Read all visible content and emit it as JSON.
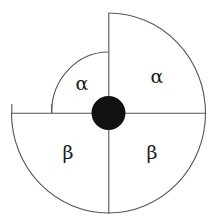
{
  "figure": {
    "background_color": "#ffffff",
    "line_color": "#555555",
    "hub_color": "#111111",
    "label_color": "#1a1a1a"
  },
  "geometry": {
    "center_x": 108.5,
    "center_y": 113.0,
    "outer_radius_x": 97,
    "outer_radius_y": 100,
    "inner_quadrant_radius_x": 57,
    "inner_quadrant_radius_y": 61,
    "hub_radius": 17,
    "vertical_axis_top_y": 13,
    "vertical_axis_bottom_y": 213,
    "horizontal_axis_left_x": 12,
    "horizontal_axis_right_x": 206
  },
  "sectors": [
    {
      "id": "upper-left",
      "label": "α",
      "label_name": "alpha",
      "radius": "small",
      "label_x": 82,
      "label_y": 83
    },
    {
      "id": "upper-right",
      "label": "α",
      "label_name": "alpha",
      "radius": "large",
      "label_x": 157,
      "label_y": 76
    },
    {
      "id": "lower-left",
      "label": "β",
      "label_name": "beta",
      "radius": "large",
      "label_x": 68,
      "label_y": 152
    },
    {
      "id": "lower-right",
      "label": "β",
      "label_name": "beta",
      "radius": "large",
      "label_x": 152,
      "label_y": 152
    }
  ],
  "axes": {
    "vertical_name": "vertical-axis",
    "horizontal_name": "horizontal-axis"
  },
  "hub": {
    "name": "center-hub"
  }
}
